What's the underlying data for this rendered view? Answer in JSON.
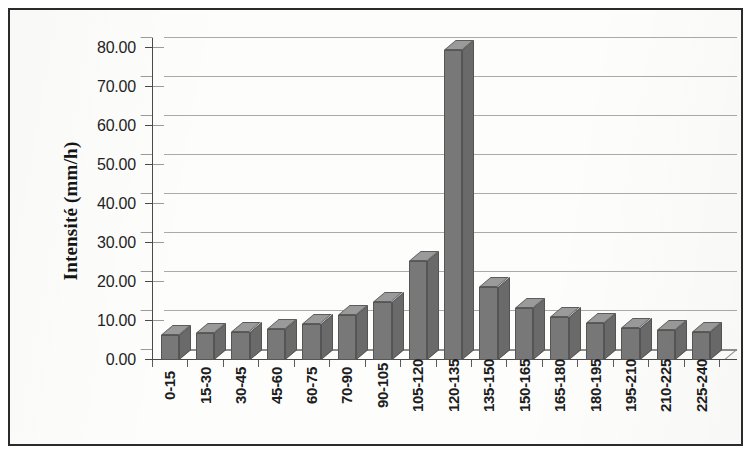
{
  "chart_data": {
    "type": "bar",
    "title": "",
    "subtitle": "",
    "xlabel": "",
    "ylabel": "Intensité (mm/h)",
    "categories": [
      "0-15",
      "15-30",
      "30-45",
      "45-60",
      "60-75",
      "70-90",
      "90-105",
      "105-120",
      "120-135",
      "135-150",
      "150-165",
      "165-180",
      "180-195",
      "195-210",
      "210-225",
      "225-240"
    ],
    "values": [
      6.3,
      7.0,
      7.3,
      8.0,
      9.3,
      11.5,
      14.8,
      25.5,
      79.5,
      18.8,
      13.3,
      11.0,
      9.5,
      8.2,
      7.8,
      7.2
    ],
    "series": [
      {
        "name": "Intensité",
        "values": [
          6.3,
          7.0,
          7.3,
          8.0,
          9.3,
          11.5,
          14.8,
          25.5,
          79.5,
          18.8,
          13.3,
          11.0,
          9.5,
          8.2,
          7.8,
          7.2
        ]
      }
    ],
    "ylim": [
      0,
      80
    ],
    "ytick_values": [
      0,
      10,
      20,
      30,
      40,
      50,
      60,
      70,
      80
    ],
    "ytick_labels": [
      "0.00",
      "10.00",
      "20.00",
      "30.00",
      "40.00",
      "50.00",
      "60.00",
      "70.00",
      "80.00"
    ],
    "grid": true,
    "grid_axis": "y",
    "legend": false,
    "legend_position": "none",
    "three_d": true,
    "annotations": [],
    "bar_color": "#787878",
    "bar_top_color": "#9a9a9a",
    "bar_side_color": "#6a6a6a",
    "gridline_color": "#9b9b9b",
    "axis_color": "#4a4a4a",
    "frame_color": "#2b2b2b",
    "background_color": "#fdfdfc",
    "text_color": "#1f1f1f"
  },
  "axes": {
    "y_title": "Intensité (mm/h)"
  }
}
